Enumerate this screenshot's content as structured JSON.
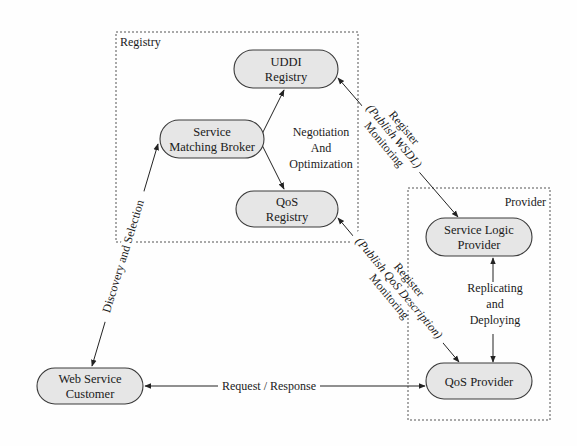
{
  "groups": {
    "registry": {
      "label": "Registry",
      "x": 116,
      "y": 32,
      "w": 242,
      "h": 210
    },
    "provider": {
      "label": "Provider",
      "x": 408,
      "y": 188,
      "w": 142,
      "h": 232
    }
  },
  "nodes": {
    "uddi": {
      "lines": [
        "UDDI",
        "Registry"
      ],
      "cx": 286,
      "cy": 69,
      "w": 104,
      "h": 38
    },
    "broker": {
      "lines": [
        "Service",
        "Matching Broker"
      ],
      "cx": 212,
      "cy": 139,
      "w": 104,
      "h": 38
    },
    "qos_registry": {
      "lines": [
        "QoS",
        "Registry"
      ],
      "cx": 287,
      "cy": 209,
      "w": 102,
      "h": 36
    },
    "service_logic": {
      "lines": [
        "Service Logic",
        "Provider"
      ],
      "cx": 479,
      "cy": 237,
      "w": 106,
      "h": 38
    },
    "qos_provider": {
      "lines": [
        "QoS Provider"
      ],
      "cx": 479,
      "cy": 381,
      "w": 106,
      "h": 36
    },
    "customer": {
      "lines": [
        "Web Service",
        "Customer"
      ],
      "cx": 90,
      "cy": 386,
      "w": 106,
      "h": 36
    }
  },
  "labels": {
    "negotiation": [
      "Negotiation",
      "And",
      "Optimization"
    ],
    "discovery": "Discovery and Selection",
    "register_uddi": [
      "Register",
      "(Publish WSDL)",
      "Monitoring"
    ],
    "register_qos": [
      "Register",
      "(Publish QoS Description)",
      "Monitoring"
    ],
    "replicating": [
      "Replicating",
      "and",
      "Deploying"
    ],
    "request_response": "Request / Response"
  },
  "colors": {
    "node_fill": "#e6e6e6",
    "node_stroke": "#3a3a3a",
    "line": "#222222",
    "dash": "#555555"
  }
}
